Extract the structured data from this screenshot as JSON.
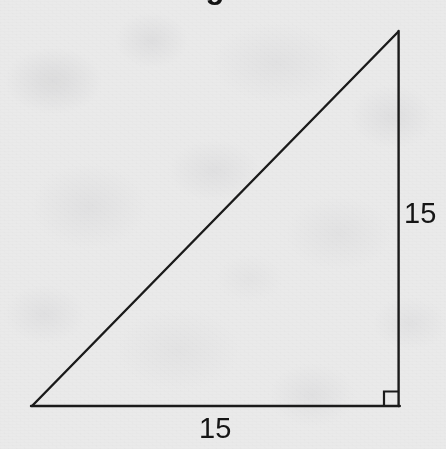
{
  "figure": {
    "name": "right-triangle-figure",
    "shape": "right triangle",
    "canvas": {
      "width": 446,
      "height": 449
    },
    "background_color": "#f4f4f4",
    "stroke_color": "#1a1a1a",
    "stroke_width": 2.4,
    "label_color": "#151515",
    "vertices": {
      "bottom_left": {
        "x": 32,
        "y": 406
      },
      "bottom_right": {
        "x": 398,
        "y": 406
      },
      "top_apex": {
        "x": 398,
        "y": 32
      }
    },
    "edges": [
      {
        "name": "horizontal-leg",
        "from": "bottom_left",
        "to": "bottom_right"
      },
      {
        "name": "vertical-leg",
        "from": "bottom_right",
        "to": "top_apex"
      },
      {
        "name": "hypotenuse",
        "from": "top_apex",
        "to": "bottom_left"
      }
    ],
    "right_angle_marker": {
      "at_vertex": "bottom_right",
      "size": 14,
      "visible": true
    },
    "labels": {
      "vertical_leg": "15",
      "horizontal_leg": "15"
    },
    "top_clipped_glyph": "g"
  }
}
